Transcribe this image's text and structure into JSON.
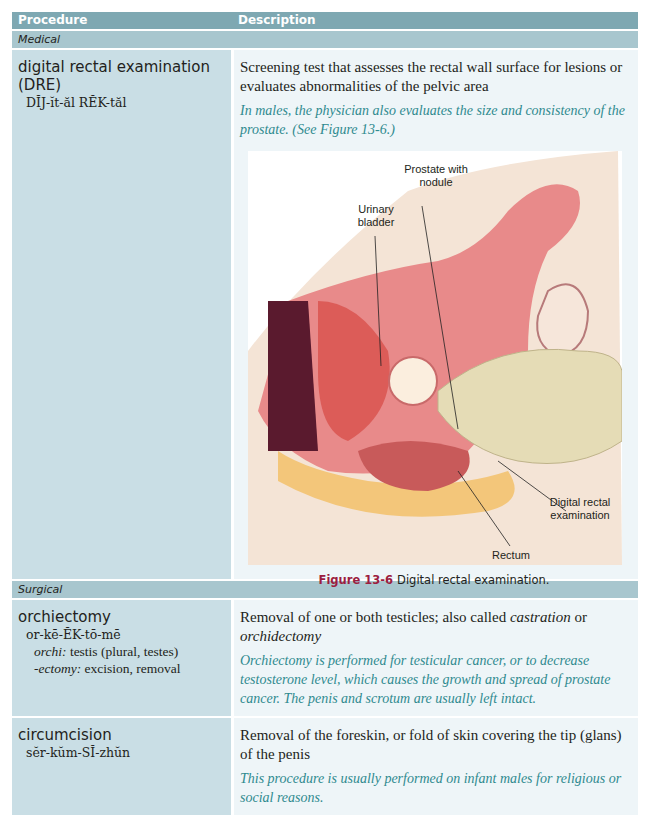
{
  "header": {
    "col1": "Procedure",
    "col2": "Description"
  },
  "sections": [
    {
      "label": "Medical",
      "rows": [
        {
          "term": "digital rectal examination (DRE)",
          "pronunciation": "DĬJ-ĭt-ăl RĔK-tăl",
          "description": "Screening test that assesses the rectal wall surface for lesions or evaluates abnormalities of the pelvic area",
          "note": "In males, the physician also evaluates the size and consistency of the prostate. (See Figure 13-6.)",
          "figure": {
            "number_label": "Figure 13-6",
            "caption": "Digital rectal examination.",
            "labels": {
              "prostate": "Prostate with nodule",
              "bladder": "Urinary bladder",
              "dre": "Digital rectal examination",
              "rectum": "Rectum"
            }
          }
        }
      ]
    },
    {
      "label": "Surgical",
      "rows": [
        {
          "term": "orchiectomy",
          "pronunciation": "or-kē-ĔK-tō-mē",
          "word_parts": [
            {
              "part": "orchi:",
              "meaning": "testis (plural, testes)"
            },
            {
              "part": "-ectomy:",
              "meaning": "excision, removal"
            }
          ],
          "description_pre": "Removal of one or both testicles; also called ",
          "description_alt1": "castration",
          "description_mid": " or ",
          "description_alt2": "orchidectomy",
          "note": "Orchiectomy is performed for testicular cancer, or to decrease testosterone level, which causes the growth and spread of prostate cancer. The penis and scrotum are usually left intact."
        },
        {
          "term": "circumcision",
          "pronunciation": "sĕr-kŭm-SĬ-zhŭn",
          "description": "Removal of the foreskin, or fold of skin covering the tip (glans) of the penis",
          "note": "This procedure is usually performed on infant males for religious or social reasons."
        }
      ]
    }
  ]
}
